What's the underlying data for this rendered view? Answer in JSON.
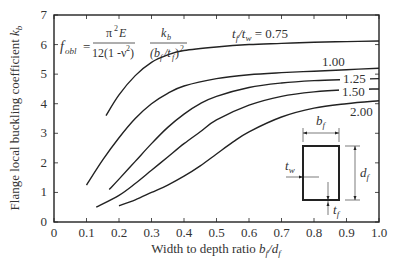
{
  "chart_data": {
    "type": "line",
    "title": "",
    "xlabel": "Width to depth ratio b_f/d_f",
    "ylabel": "Flange local buckling coefficient k_b",
    "xlim": [
      0,
      1.0
    ],
    "ylim": [
      0,
      7
    ],
    "x_ticks": [
      "0",
      "0.1",
      "0.2",
      "0.3",
      "0.4",
      "0.5",
      "0.6",
      "0.7",
      "0.8",
      "0.9",
      "1.0"
    ],
    "y_ticks": [
      "0",
      "1",
      "2",
      "3",
      "4",
      "5",
      "6",
      "7"
    ],
    "grid": false,
    "formula": "f_obl = π²E / 12(1 - ν²) · k_b / (b_f/t_f)²",
    "legend_title": "t_f/t_w",
    "series": [
      {
        "name": "t_f/t_w = 0.75",
        "label": "t_f/t_w = 0.75",
        "points": [
          [
            0.16,
            3.6
          ],
          [
            0.2,
            4.3
          ],
          [
            0.25,
            4.95
          ],
          [
            0.3,
            5.4
          ],
          [
            0.35,
            5.65
          ],
          [
            0.4,
            5.8
          ],
          [
            0.5,
            5.92
          ],
          [
            0.6,
            6.0
          ],
          [
            0.7,
            6.04
          ],
          [
            0.8,
            6.08
          ],
          [
            0.9,
            6.1
          ],
          [
            1.0,
            6.12
          ]
        ]
      },
      {
        "name": "1.00",
        "label": "1.00",
        "points": [
          [
            0.1,
            1.25
          ],
          [
            0.15,
            2.1
          ],
          [
            0.2,
            2.85
          ],
          [
            0.25,
            3.5
          ],
          [
            0.3,
            4.0
          ],
          [
            0.35,
            4.35
          ],
          [
            0.4,
            4.6
          ],
          [
            0.5,
            4.85
          ],
          [
            0.6,
            4.98
          ],
          [
            0.7,
            5.05
          ],
          [
            0.8,
            5.1
          ],
          [
            0.9,
            5.15
          ],
          [
            1.0,
            5.2
          ]
        ]
      },
      {
        "name": "1.25",
        "label": "1.25",
        "points": [
          [
            0.17,
            1.1
          ],
          [
            0.2,
            1.45
          ],
          [
            0.25,
            2.05
          ],
          [
            0.3,
            2.65
          ],
          [
            0.35,
            3.2
          ],
          [
            0.4,
            3.65
          ],
          [
            0.45,
            4.0
          ],
          [
            0.5,
            4.25
          ],
          [
            0.6,
            4.55
          ],
          [
            0.7,
            4.7
          ],
          [
            0.8,
            4.78
          ],
          [
            0.9,
            4.82
          ],
          [
            1.0,
            4.85
          ]
        ]
      },
      {
        "name": "1.50",
        "label": "1.50",
        "points": [
          [
            0.13,
            0.5
          ],
          [
            0.2,
            0.9
          ],
          [
            0.25,
            1.3
          ],
          [
            0.3,
            1.75
          ],
          [
            0.35,
            2.2
          ],
          [
            0.4,
            2.65
          ],
          [
            0.45,
            3.05
          ],
          [
            0.5,
            3.45
          ],
          [
            0.6,
            3.95
          ],
          [
            0.7,
            4.25
          ],
          [
            0.8,
            4.4
          ],
          [
            0.9,
            4.47
          ],
          [
            1.0,
            4.5
          ]
        ]
      },
      {
        "name": "2.00",
        "label": "2.00",
        "points": [
          [
            0.2,
            0.55
          ],
          [
            0.25,
            0.75
          ],
          [
            0.3,
            1.0
          ],
          [
            0.35,
            1.25
          ],
          [
            0.4,
            1.55
          ],
          [
            0.45,
            1.9
          ],
          [
            0.5,
            2.3
          ],
          [
            0.55,
            2.7
          ],
          [
            0.6,
            3.05
          ],
          [
            0.7,
            3.55
          ],
          [
            0.8,
            3.85
          ],
          [
            0.9,
            4.0
          ],
          [
            1.0,
            4.1
          ]
        ]
      }
    ],
    "inset_labels": {
      "width": "b_f",
      "depth": "d_f",
      "web": "t_w",
      "flange": "t_f"
    }
  }
}
